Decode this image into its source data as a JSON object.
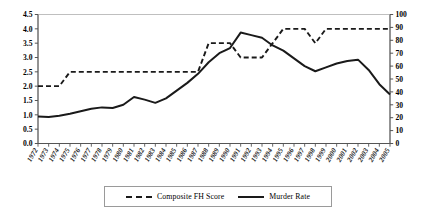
{
  "chart_data": {
    "type": "line",
    "title": "",
    "xlabel": "",
    "ylabel": "",
    "y2label": "",
    "grid": false,
    "legend_position": "bottom",
    "x": [
      1972,
      1973,
      1974,
      1975,
      1976,
      1977,
      1978,
      1979,
      1980,
      1981,
      1982,
      1983,
      1984,
      1985,
      1986,
      1987,
      1988,
      1989,
      1990,
      1991,
      1992,
      1993,
      1994,
      1995,
      1996,
      1997,
      1998,
      1999,
      2000,
      2001,
      2002,
      2003,
      2004,
      2005
    ],
    "xticklabels": [
      "1972",
      "1973",
      "1974",
      "1975",
      "1976",
      "1977",
      "1978",
      "1979",
      "1980",
      "1981",
      "1982",
      "1983",
      "1984",
      "1985",
      "1986",
      "1987",
      "1988",
      "1989",
      "1990",
      "1991",
      "1992",
      "1993",
      "1994",
      "1995",
      "1996",
      "1997",
      "1998",
      "1999",
      "2000",
      "2001",
      "2002",
      "2003",
      "2004",
      "2005"
    ],
    "ylim": [
      0,
      4.5
    ],
    "yticks": [
      0.0,
      0.5,
      1.0,
      1.5,
      2.0,
      2.5,
      3.0,
      3.5,
      4.0,
      4.5
    ],
    "yticklabels": [
      "0.0",
      "0.5",
      "1.0",
      "1.5",
      "2.0",
      "2.5",
      "3.0",
      "3.5",
      "4.0",
      "4.5"
    ],
    "y2lim": [
      0,
      100
    ],
    "y2ticks": [
      0,
      10,
      20,
      30,
      40,
      50,
      60,
      70,
      80,
      90,
      100
    ],
    "y2ticklabels": [
      "0",
      "10",
      "20",
      "30",
      "40",
      "50",
      "60",
      "70",
      "80",
      "90",
      "100"
    ],
    "series": [
      {
        "name": "Composite FH Score",
        "style": "dashed",
        "axis": "left",
        "color": "#1a1a1a",
        "values": [
          2.0,
          2.0,
          2.0,
          2.5,
          2.5,
          2.5,
          2.5,
          2.5,
          2.5,
          2.5,
          2.5,
          2.5,
          2.5,
          2.5,
          2.5,
          2.5,
          3.5,
          3.5,
          3.5,
          3.0,
          3.0,
          3.0,
          3.5,
          4.0,
          4.0,
          4.0,
          3.5,
          4.0,
          4.0,
          4.0,
          4.0,
          4.0,
          4.0,
          4.0
        ]
      },
      {
        "name": "Murder Rate",
        "style": "solid",
        "axis": "right",
        "color": "#1a1a1a",
        "values": [
          21,
          20.5,
          21.5,
          23,
          25,
          27,
          28,
          27.5,
          30,
          36,
          34,
          31.5,
          35,
          41,
          47,
          54,
          63,
          70,
          74,
          86,
          84,
          82,
          76,
          72,
          66,
          60,
          56,
          59,
          62,
          64,
          65,
          57,
          46,
          38
        ]
      }
    ]
  },
  "legend": {
    "items": [
      {
        "label": "Composite FH Score",
        "style": "dashed"
      },
      {
        "label": "Murder Rate",
        "style": "solid"
      }
    ]
  }
}
